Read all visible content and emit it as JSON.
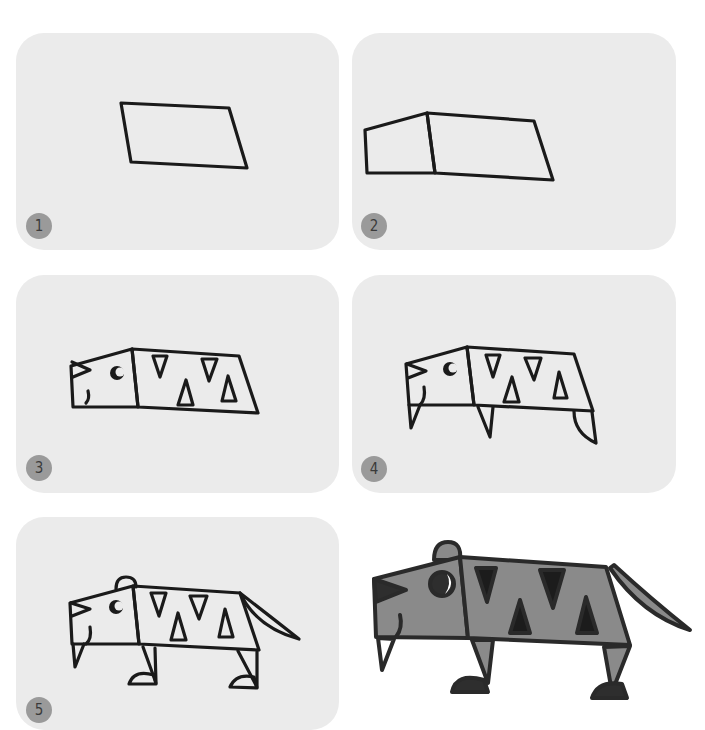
{
  "steps": [
    {
      "number": "1",
      "caption": "Draw a slanted rectangle for the body"
    },
    {
      "number": "2",
      "caption": "Add the head box"
    },
    {
      "number": "3",
      "caption": "Add eye, nose, mouth and stripe triangles"
    },
    {
      "number": "4",
      "caption": "Add fangs and legs"
    },
    {
      "number": "5",
      "caption": "Add ear, tail and paws"
    }
  ],
  "final": {
    "label": "finished tiger"
  },
  "colors": {
    "panel_bg": "#ebebeb",
    "badge_bg": "#9a9a9a",
    "line": "#1a1a1a",
    "tiger_body": "#8a8a8a",
    "tiger_dark": "#2e2e2e",
    "stripe": "#1c1c1c"
  }
}
